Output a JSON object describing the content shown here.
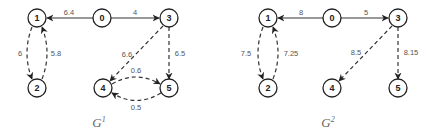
{
  "graphs": [
    {
      "caption": "G",
      "caption_sup": "1",
      "nodes": [
        {
          "id": "0",
          "x": 102,
          "y": 18
        },
        {
          "id": "1",
          "x": 37,
          "y": 18
        },
        {
          "id": "2",
          "x": 37,
          "y": 88
        },
        {
          "id": "3",
          "x": 169,
          "y": 18
        },
        {
          "id": "4",
          "x": 103,
          "y": 88
        },
        {
          "id": "5",
          "x": 169,
          "y": 88
        }
      ],
      "edges": [
        {
          "from": "0",
          "to": "1",
          "weight": "6.4",
          "style": "solid"
        },
        {
          "from": "0",
          "to": "3",
          "weight": "4",
          "style": "solid"
        },
        {
          "from": "1",
          "to": "2",
          "weight": "6",
          "style": "dashed"
        },
        {
          "from": "2",
          "to": "1",
          "weight": "5.8",
          "style": "dashed"
        },
        {
          "from": "3",
          "to": "4",
          "weight": "6.6",
          "style": "dashed"
        },
        {
          "from": "3",
          "to": "5",
          "weight": "6.5",
          "style": "dashed"
        },
        {
          "from": "4",
          "to": "5",
          "weight": "0.6",
          "style": "dashed"
        },
        {
          "from": "5",
          "to": "4",
          "weight": "0.5",
          "style": "dashed"
        }
      ]
    },
    {
      "caption": "G",
      "caption_sup": "2",
      "nodes": [
        {
          "id": "0",
          "x": 332,
          "y": 18
        },
        {
          "id": "1",
          "x": 268,
          "y": 18
        },
        {
          "id": "2",
          "x": 268,
          "y": 88
        },
        {
          "id": "3",
          "x": 398,
          "y": 18
        },
        {
          "id": "4",
          "x": 332,
          "y": 88
        },
        {
          "id": "5",
          "x": 398,
          "y": 88
        }
      ],
      "edges": [
        {
          "from": "0",
          "to": "1",
          "weight": "8",
          "style": "solid"
        },
        {
          "from": "0",
          "to": "3",
          "weight": "5",
          "style": "solid"
        },
        {
          "from": "1",
          "to": "2",
          "weight": "7.5",
          "style": "dashed"
        },
        {
          "from": "2",
          "to": "1",
          "weight": "7.25",
          "style": "dashed"
        },
        {
          "from": "3",
          "to": "4",
          "weight": "8.5",
          "style": "dashed"
        },
        {
          "from": "3",
          "to": "5",
          "weight": "8.15",
          "style": "dashed"
        }
      ]
    }
  ]
}
